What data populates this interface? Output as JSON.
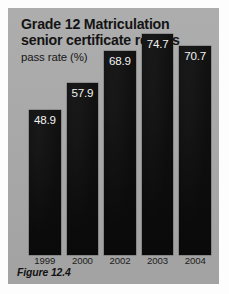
{
  "figure": {
    "caption": "Figure 12.4",
    "panel_color": "#a9a9a9",
    "bar_color": "#0d0d0d",
    "label_color": "#f2f2f2"
  },
  "chart_data": {
    "type": "bar",
    "title": "Grade 12 Matriculation\nsenior certificate results",
    "title_line_1": "Grade 12 Matriculation",
    "title_line_2": "senior certificate results",
    "subtitle": "pass rate (%)",
    "xlabel": "",
    "ylabel": "pass rate (%)",
    "ylim": [
      0,
      80
    ],
    "grid": false,
    "legend": false,
    "categories": [
      "1999",
      "2000",
      "2002",
      "2003",
      "2004"
    ],
    "values": [
      48.9,
      57.9,
      68.9,
      74.7,
      70.7
    ],
    "value_labels": [
      "48.9",
      "57.9",
      "68.9",
      "74.7",
      "70.7"
    ],
    "bars": [
      {
        "category": "1999",
        "value": 48.9,
        "label": "48.9"
      },
      {
        "category": "2000",
        "value": 57.9,
        "label": "57.9"
      },
      {
        "category": "2002",
        "value": 68.9,
        "label": "68.9"
      },
      {
        "category": "2003",
        "value": 74.7,
        "label": "74.7"
      },
      {
        "category": "2004",
        "value": 70.7,
        "label": "70.7"
      }
    ]
  }
}
